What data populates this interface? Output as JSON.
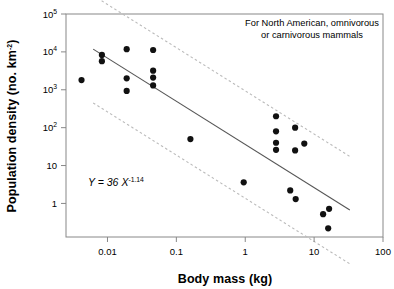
{
  "chart_data": {
    "type": "scatter",
    "title": "",
    "xlabel": "Body mass  (kg)",
    "ylabel": "Population density  (no. km",
    "ylabel_sup": "-2",
    "ylabel_tail": ")",
    "xscale": "log",
    "yscale": "log",
    "xlim": [
      0.0025,
      100
    ],
    "ylim": [
      0.13,
      100000
    ],
    "grid": false,
    "legend": null,
    "xticks": [
      {
        "value": 0.01,
        "label": "0.01"
      },
      {
        "value": 0.1,
        "label": "0.1"
      },
      {
        "value": 1,
        "label": "1"
      },
      {
        "value": 10,
        "label": "10"
      },
      {
        "value": 100,
        "label": "100"
      }
    ],
    "yticks": [
      {
        "value": 1,
        "label": "1",
        "mantissa": "1",
        "exponent": ""
      },
      {
        "value": 10,
        "label": "10",
        "mantissa": "10",
        "exponent": ""
      },
      {
        "value": 100,
        "label": "10^2",
        "mantissa": "10",
        "exponent": "2"
      },
      {
        "value": 1000,
        "label": "10^3",
        "mantissa": "10",
        "exponent": "3"
      },
      {
        "value": 10000,
        "label": "10^4",
        "mantissa": "10",
        "exponent": "4"
      },
      {
        "value": 100000,
        "label": "10^5",
        "mantissa": "10",
        "exponent": "5"
      }
    ],
    "points": [
      {
        "x": 0.0042,
        "y": 1800
      },
      {
        "x": 0.0083,
        "y": 8300
      },
      {
        "x": 0.0083,
        "y": 5700
      },
      {
        "x": 0.019,
        "y": 11800
      },
      {
        "x": 0.019,
        "y": 2000
      },
      {
        "x": 0.019,
        "y": 930
      },
      {
        "x": 0.046,
        "y": 11200
      },
      {
        "x": 0.046,
        "y": 3200
      },
      {
        "x": 0.046,
        "y": 2100
      },
      {
        "x": 0.046,
        "y": 1300
      },
      {
        "x": 0.16,
        "y": 50
      },
      {
        "x": 0.95,
        "y": 3.6
      },
      {
        "x": 2.8,
        "y": 200
      },
      {
        "x": 2.8,
        "y": 80
      },
      {
        "x": 2.8,
        "y": 40
      },
      {
        "x": 2.8,
        "y": 26
      },
      {
        "x": 5.3,
        "y": 100
      },
      {
        "x": 5.3,
        "y": 25
      },
      {
        "x": 7.2,
        "y": 38
      },
      {
        "x": 4.5,
        "y": 2.2
      },
      {
        "x": 5.4,
        "y": 1.3
      },
      {
        "x": 13.5,
        "y": 0.52
      },
      {
        "x": 16.5,
        "y": 0.72
      },
      {
        "x": 16.0,
        "y": 0.22
      }
    ],
    "fit_line": {
      "style": "solid",
      "equation_display": "Y = 36 X",
      "equation_exponent": "-1.14",
      "coefficient": 36,
      "exponent": -1.14,
      "x_start": 0.0062,
      "x_end": 33.0
    },
    "confidence_bands": [
      {
        "name": "upper-band",
        "style": "dotted",
        "factor": 26,
        "x_start": 0.0062,
        "x_end": 33.0
      },
      {
        "name": "lower-band",
        "style": "dotted",
        "factor": 0.038,
        "x_start": 0.0062,
        "x_end": 33.0
      }
    ],
    "annotations": [
      {
        "name": "group-caption",
        "line1": "For North American, omnivorous",
        "line2": "or carnivorous mammals"
      }
    ],
    "colors": {
      "marker": "#111111",
      "fit_line": "#555555",
      "band_line": "#bbbbbb",
      "axis": "#888888",
      "text": "#000000"
    }
  }
}
